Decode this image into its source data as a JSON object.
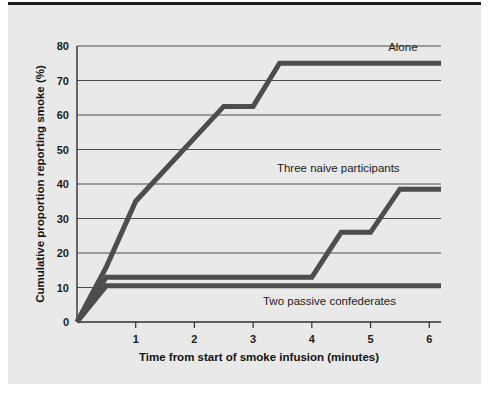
{
  "figure": {
    "background_color": "#e9e9e9",
    "page_color": "#ffffff",
    "line_color": "#4d4d4d",
    "axis_color": "#2e2e2e",
    "top_rule_color": "#1d1d1d"
  },
  "chart_data": {
    "type": "line",
    "title": "",
    "subtitle": "",
    "xlabel": "Time from start of smoke infusion (minutes)",
    "ylabel": "Cumulative proportion reporting smoke (%)",
    "xlim": [
      0,
      6.2
    ],
    "ylim": [
      0,
      80
    ],
    "xticks": [
      1,
      2,
      3,
      4,
      5,
      6
    ],
    "xtick_labels": [
      "1",
      "2",
      "3",
      "4",
      "5",
      "6"
    ],
    "yticks": [
      0,
      10,
      20,
      30,
      40,
      50,
      60,
      70,
      80
    ],
    "ytick_labels": [
      "0",
      "10",
      "20",
      "30",
      "40",
      "50",
      "60",
      "70",
      "80"
    ],
    "grid": "horizontal",
    "legend_position": "inline-annotations",
    "series": [
      {
        "name": "Alone",
        "label": "Alone",
        "label_x": 5.55,
        "label_y": 78.5,
        "color": "#4d4d4d",
        "x": [
          0,
          0.5,
          1.0,
          2.5,
          3.0,
          3.45,
          6.2
        ],
        "y": [
          0,
          16,
          35,
          62.5,
          62.5,
          75,
          75
        ]
      },
      {
        "name": "Three naive participants",
        "label": "Three naive participants",
        "label_x": 4.45,
        "label_y": 43.5,
        "color": "#4d4d4d",
        "x": [
          0,
          0.5,
          4.0,
          4.5,
          5.0,
          5.5,
          6.2
        ],
        "y": [
          0,
          13,
          13,
          26,
          26,
          38.5,
          38.5
        ]
      },
      {
        "name": "Two passive confederates",
        "label": "Two passive confederates",
        "label_x": 4.3,
        "label_y": 5.0,
        "color": "#4d4d4d",
        "x": [
          0,
          0.5,
          6.2
        ],
        "y": [
          0,
          10.5,
          10.5
        ]
      }
    ]
  }
}
